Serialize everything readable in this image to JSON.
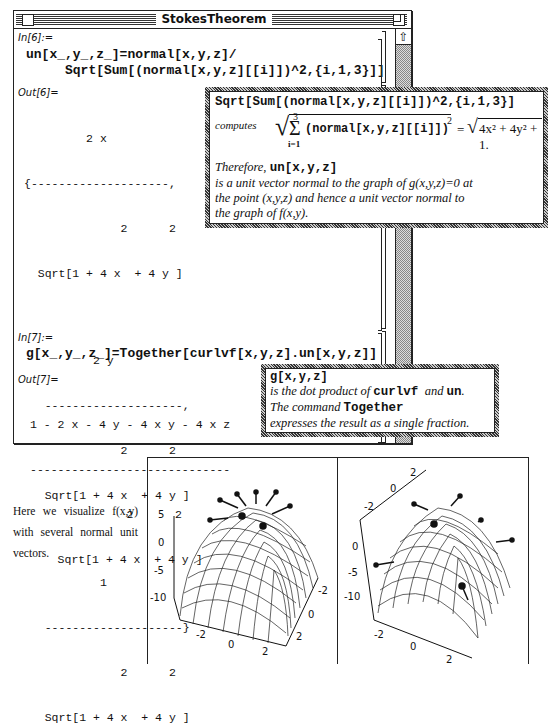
{
  "window": {
    "title": "StokesTheorem",
    "scroll_up_glyph": "⇧"
  },
  "cells": {
    "in6": {
      "label": "In[6]:=",
      "line1": "un[x_,y_,z_]=normal[x,y,z]/",
      "line2": "     Sqrt[Sum[(normal[x,y,z][[i]])^2,{i,1,3}]]"
    },
    "out6": {
      "label": "Out[6]=",
      "lines": [
        "         2 x",
        "{--------------------,",
        "              2      2",
        "  Sqrt[1 + 4 x  + 4 y ]",
        "",
        "          2 y",
        "   --------------------,",
        "              2      2",
        "   Sqrt[1 + 4 x  + 4 y ]",
        "",
        "           1",
        "   --------------------}",
        "              2      2",
        "   Sqrt[1 + 4 x  + 4 y ]"
      ]
    },
    "in7": {
      "label": "In[7]:=",
      "line1": "g[x_,y_,z_]=Together[curlvf[x,y,z].un[x,y,z]]"
    },
    "out7": {
      "label": "Out[7]=",
      "lines": [
        "1 - 2 x - 4 y - 4 x y - 4 x z",
        "-----------------------------",
        "              2      2",
        "    Sqrt[1 + 4 x  + 4 y ]"
      ]
    }
  },
  "note1": {
    "header": "Sqrt[Sum[(normal[x,y,z][[i]])^2,{i,1,3}]",
    "computes_label": "computes",
    "sum_upper": "3",
    "sum_lower": "i=1",
    "sum_body": "(normal[x,y,z][[i]])",
    "exp2": "2",
    "equals": "=",
    "result": "4x² + 4y² + 1.",
    "therefore": "Therefore,",
    "un_expr": "un[x,y,z]",
    "text1": "is a unit vector normal to the graph of g(x,y,z)=0 at",
    "text2": "the point (x,y,z) and hence a unit vector normal to",
    "text3": "the graph of f(x,y)."
  },
  "note2": {
    "header": "g[x,y,z]",
    "t1a": "is the dot product of",
    "t1b": "curlvf",
    "t1c": "and",
    "t1d": "un",
    "t1e": ".",
    "t2a": "The command",
    "t2b": "Together",
    "t3": "expresses the result as a single fraction."
  },
  "caption": {
    "text": "Here we visualize f(x,y) with several normal unit vectors."
  },
  "plots": {
    "left": {
      "z_ticks": [
        "5",
        "0",
        "-5",
        "-10"
      ],
      "x_ticks": [
        "-2",
        "0",
        "2"
      ],
      "y_ticks": [
        "-2",
        "0",
        "2"
      ]
    },
    "right": {
      "top_ticks": [
        "-2",
        "0",
        "2"
      ],
      "z_ticks": [
        "0",
        "-5",
        "-10"
      ],
      "x_ticks": [
        "-2",
        "0",
        "2"
      ]
    }
  }
}
